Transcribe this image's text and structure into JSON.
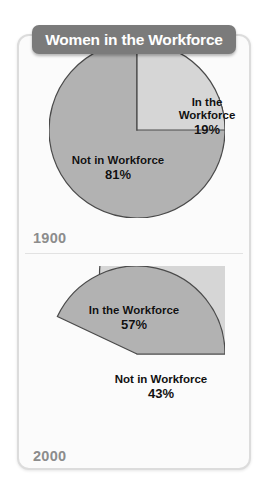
{
  "header": {
    "title": "Women in the Workforce"
  },
  "colors": {
    "banner_bg": "#7b7b7b",
    "banner_text": "#ffffff",
    "card_bg": "#fbfbfb",
    "card_border": "#dcdcdc",
    "slice_light": "#d6d6d6",
    "slice_medium": "#b2b2b2",
    "slice_stroke": "#4a4a4a",
    "year_text": "#8c8c8c",
    "label_text": "#111111",
    "page_bg": "#ffffff"
  },
  "chart_data": [
    {
      "type": "pie",
      "title": "Women in the Workforce",
      "year": "1900",
      "labels": [
        "In the Workforce",
        "Not in Workforce"
      ],
      "values": [
        19,
        81
      ],
      "value_labels": [
        "19%",
        "81%"
      ],
      "unit": "%",
      "start_angle_deg": 0,
      "direction": "clockwise",
      "slice_colors": [
        "#d6d6d6",
        "#b2b2b2"
      ],
      "legend": "none",
      "grid": false
    },
    {
      "type": "pie",
      "title": "Women in the Workforce",
      "year": "2000",
      "labels": [
        "In the Workforce",
        "Not in Workforce"
      ],
      "values": [
        57,
        43
      ],
      "value_labels": [
        "57%",
        "43%"
      ],
      "unit": "%",
      "start_angle_deg": 90,
      "direction": "counterclockwise",
      "slice_colors": [
        "#d6d6d6",
        "#b2b2b2"
      ],
      "legend": "none",
      "grid": false
    }
  ],
  "panels": [
    {
      "year": "1900",
      "slices": [
        {
          "name": "In the Workforce",
          "value": "19%"
        },
        {
          "name": "Not in Workforce",
          "value": "81%"
        }
      ]
    },
    {
      "year": "2000",
      "slices": [
        {
          "name": "In the Workforce",
          "value": "57%"
        },
        {
          "name": "Not in Workforce",
          "value": "43%"
        }
      ]
    }
  ]
}
